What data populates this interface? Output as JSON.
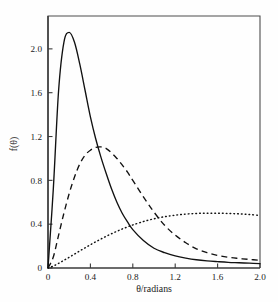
{
  "chart_data": {
    "type": "line",
    "title": "",
    "subtitle": "",
    "xlabel": "θ/radians",
    "ylabel": "f(θ)",
    "xlim": [
      0,
      2.0
    ],
    "ylim": [
      0,
      2.3
    ],
    "xticks": [
      "0",
      "0.4",
      "0.8",
      "1.2",
      "1.6",
      "2.0"
    ],
    "xtick_values": [
      0,
      0.4,
      0.8,
      1.2,
      1.6,
      2.0
    ],
    "yticks": [
      "0",
      "0.4",
      "0.8",
      "1.2",
      "1.6",
      "2.0"
    ],
    "ytick_values": [
      0,
      0.4,
      0.8,
      1.2,
      1.6,
      2.0
    ],
    "grid": false,
    "legend": "none",
    "frame": "box",
    "annotations": [],
    "x": [
      0.0,
      0.05,
      0.1,
      0.15,
      0.2,
      0.25,
      0.3,
      0.35,
      0.4,
      0.45,
      0.5,
      0.55,
      0.6,
      0.65,
      0.7,
      0.75,
      0.8,
      0.9,
      1.0,
      1.1,
      1.2,
      1.3,
      1.4,
      1.5,
      1.6,
      1.7,
      1.8,
      1.9,
      2.0
    ],
    "series": [
      {
        "name": "narrow-distribution",
        "style": "solid",
        "color": "#111111",
        "peak_x": 0.19,
        "peak_y": 2.15,
        "values": [
          0.0,
          0.72,
          1.62,
          2.06,
          2.15,
          2.06,
          1.86,
          1.62,
          1.38,
          1.18,
          1.01,
          0.86,
          0.72,
          0.6,
          0.5,
          0.42,
          0.35,
          0.25,
          0.18,
          0.14,
          0.11,
          0.09,
          0.075,
          0.065,
          0.058,
          0.052,
          0.048,
          0.044,
          0.04
        ]
      },
      {
        "name": "medium-distribution",
        "style": "dashed",
        "color": "#111111",
        "peak_x": 0.5,
        "peak_y": 1.1,
        "values": [
          0.0,
          0.1,
          0.3,
          0.5,
          0.68,
          0.83,
          0.95,
          1.03,
          1.075,
          1.1,
          1.105,
          1.09,
          1.05,
          1.0,
          0.94,
          0.875,
          0.8,
          0.65,
          0.51,
          0.39,
          0.3,
          0.23,
          0.175,
          0.14,
          0.115,
          0.098,
          0.087,
          0.078,
          0.07
        ]
      },
      {
        "name": "broad-distribution",
        "style": "dotted",
        "color": "#111111",
        "peak_x": 1.55,
        "peak_y": 0.5,
        "values": [
          0.0,
          0.018,
          0.042,
          0.07,
          0.098,
          0.127,
          0.156,
          0.184,
          0.212,
          0.239,
          0.265,
          0.29,
          0.313,
          0.335,
          0.356,
          0.375,
          0.393,
          0.424,
          0.449,
          0.468,
          0.482,
          0.492,
          0.498,
          0.5,
          0.5,
          0.498,
          0.494,
          0.488,
          0.48
        ]
      }
    ]
  }
}
